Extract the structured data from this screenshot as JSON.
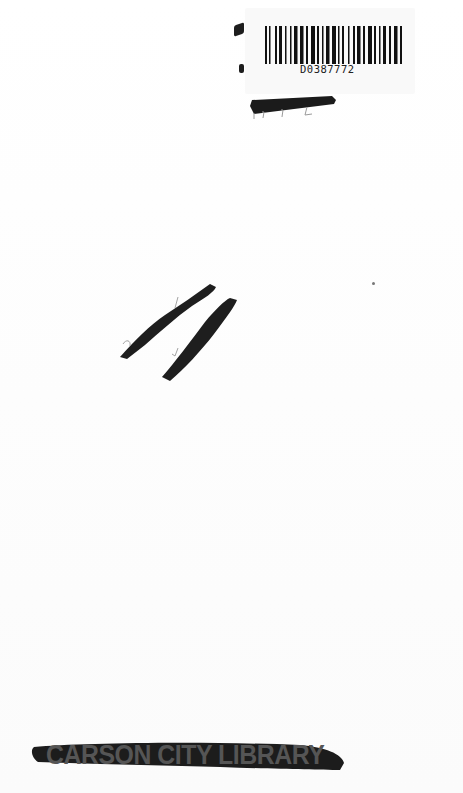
{
  "page": {
    "type": "scanned-book-endpaper",
    "background": "#fdfdfd"
  },
  "barcode": {
    "number": "D0387772",
    "icon": "barcode-icon"
  },
  "pencil_marks": {
    "under_barcode": "??? (struck through)",
    "handwritten_fraction": "2 / 1 (struck through)"
  },
  "stamp": {
    "text": "CARSON CITY LIBRARY",
    "struck_through": true
  },
  "colors": {
    "ink": "#1d1d1d",
    "stamp": "#555555"
  }
}
